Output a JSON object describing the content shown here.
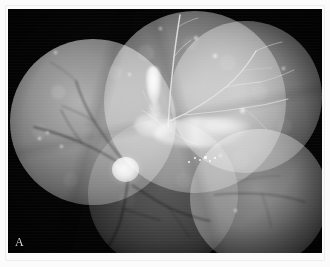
{
  "figure": {
    "panel_label": "A",
    "modality": "fundus-fluorescein-angiography",
    "view": "wide-field-montage",
    "background_color": "#050505",
    "border_color": "#fbfbfb",
    "label_color": "#d8d8d8"
  },
  "canvas": {
    "width_px": 314,
    "height_px": 244,
    "offset_x_px": 8,
    "offset_y_px": 9
  },
  "montage_fields": [
    {
      "name": "left-temporal-field",
      "cx": 85,
      "cy": 113,
      "r": 83,
      "brightness": "bright"
    },
    {
      "name": "superior-central-field",
      "cx": 187,
      "cy": 93,
      "r": 91,
      "brightness": "bright"
    },
    {
      "name": "superior-temporal-field",
      "cx": 238,
      "cy": 88,
      "r": 76,
      "brightness": "medium"
    },
    {
      "name": "inferior-temporal-field",
      "cx": 251,
      "cy": 189,
      "r": 69,
      "brightness": "medium"
    },
    {
      "name": "inferior-central-field",
      "cx": 155,
      "cy": 185,
      "r": 75,
      "brightness": "dark"
    }
  ],
  "features": [
    {
      "name": "optic-disc",
      "label": "Optic disc",
      "x": 117,
      "y": 160,
      "appearance": "round hyperfluorescent"
    },
    {
      "name": "superior-plaque",
      "label": "Hyperfluorescent plaque",
      "x": 145,
      "y": 76,
      "appearance": "vertical bright lesion"
    },
    {
      "name": "central-leakage",
      "label": "Leakage / staining",
      "x": 191,
      "y": 123,
      "appearance": "bright band"
    },
    {
      "name": "temporal-leakage",
      "label": "Temporal staining",
      "x": 219,
      "y": 117,
      "appearance": "diffuse bright"
    },
    {
      "name": "punctate-hyperfluorescence",
      "label": "Punctate hyperfluorescent dots",
      "x": 182,
      "y": 150,
      "appearance": "dot cluster"
    },
    {
      "name": "vascular-arcades",
      "label": "Retinal vascular arcades",
      "x": 160,
      "y": 120,
      "appearance": "branching vessels"
    }
  ],
  "vessels": {
    "description": "retinal arteriovenous arcades radiating from the optic disc",
    "stroke_color": "#dcdcdc",
    "dark_stroke_color": "#101010"
  }
}
